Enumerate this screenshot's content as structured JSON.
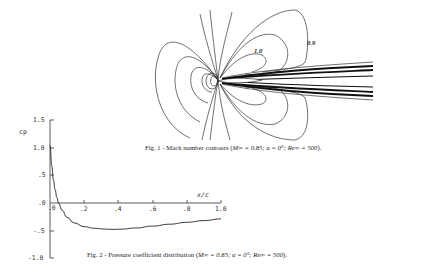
{
  "figures": [
    {
      "id": "fig1",
      "caption_prefix": "Fig. 1 - Mach number contours (",
      "caption_params": "M∞ = 0.85; α = 0°; Re∞ = 500",
      "caption_suffix": ").",
      "contour_labels": [
        "1.0",
        "0.9"
      ]
    },
    {
      "id": "fig2",
      "caption_prefix": "Fig. 2 - Pressure coefficient distribution (",
      "caption_params": "M∞ = 0.85; α = 0°; Re∞ = 500",
      "caption_suffix": ")."
    }
  ],
  "chart_data": [
    {
      "type": "contour",
      "title": "Fig. 1 - Mach number contours (M∞ = 0.85; α = 0°; Re∞ = 500).",
      "contour_labels": [
        {
          "text": "1.0",
          "value": 1.0
        },
        {
          "text": "0.9",
          "value": 0.9
        }
      ],
      "annotations": [
        "stagnation point at leading edge",
        "dense contours in wake region"
      ]
    },
    {
      "type": "line",
      "title": "Fig. 2 - Pressure coefficient distribution (M∞ = 0.85; α = 0°; Re∞ = 500).",
      "xlabel": "x/c",
      "ylabel": "cp",
      "xlim": [
        0,
        1.0
      ],
      "ylim": [
        -1.0,
        1.5
      ],
      "x_ticks": [
        ".0",
        ".2",
        ".4",
        ".6",
        ".8",
        "1.0"
      ],
      "y_ticks": [
        "1.5",
        "1.0",
        ".5",
        ".0",
        "-.5",
        "-1.0"
      ],
      "grid": false,
      "series": [
        {
          "name": "cp",
          "x": [
            0.0,
            0.01,
            0.02,
            0.03,
            0.04,
            0.05,
            0.07,
            0.1,
            0.14,
            0.2,
            0.26,
            0.32,
            0.37,
            0.42,
            0.5,
            0.6,
            0.7,
            0.8,
            0.9,
            1.0
          ],
          "y": [
            1.05,
            0.68,
            0.42,
            0.24,
            0.1,
            0.0,
            -0.13,
            -0.26,
            -0.36,
            -0.43,
            -0.46,
            -0.475,
            -0.48,
            -0.475,
            -0.455,
            -0.42,
            -0.385,
            -0.35,
            -0.32,
            -0.29
          ]
        }
      ]
    }
  ]
}
